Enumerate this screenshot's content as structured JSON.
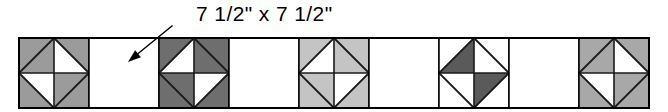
{
  "diagram": {
    "annotation": {
      "label": "7 1/2\" x 7 1/2\"",
      "points_to_block_index": 2,
      "arrow_from": [
        172,
        26
      ],
      "arrow_to": [
        128,
        62
      ]
    },
    "row": {
      "x": 19,
      "y": 38,
      "block_size": 70,
      "block_count": 9,
      "outline_color": "#000000",
      "outline_width": 1.5
    },
    "colors": {
      "background": "#ffffff",
      "outline": "#000000",
      "seam": "#1a1a1a",
      "plain": "#ffffff",
      "shade_medium": "#9b9b9b",
      "shade_medium_light": "#a8a8a8",
      "shade_light": "#c4c4c4",
      "shade_dark": "#6e6e6e",
      "shade_darkest": "#5a5a5a",
      "text": "#000000"
    },
    "blocks": [
      {
        "index": 1,
        "type": "square-in-a-square",
        "fill": "#9b9b9b",
        "corners": "shaded",
        "inner_diamond": "alternating",
        "inner_pattern": [
          "shaded",
          "plain",
          "shaded",
          "plain"
        ]
      },
      {
        "index": 2,
        "type": "plain",
        "fill": "#ffffff",
        "label": "7 1/2\" x 7 1/2\""
      },
      {
        "index": 3,
        "type": "square-in-a-square",
        "fill": "#6e6e6e",
        "corners": "shaded",
        "inner_diamond": "alternating",
        "inner_pattern": [
          "plain",
          "shaded",
          "plain",
          "shaded"
        ]
      },
      {
        "index": 4,
        "type": "plain",
        "fill": "#ffffff"
      },
      {
        "index": 5,
        "type": "square-in-a-square",
        "fill": "#c4c4c4",
        "corners": "shaded",
        "inner_diamond": "alternating",
        "inner_pattern": [
          "plain",
          "shaded",
          "plain",
          "shaded"
        ]
      },
      {
        "index": 6,
        "type": "plain",
        "fill": "#ffffff"
      },
      {
        "index": 7,
        "type": "square-in-a-square",
        "fill": "#5a5a5a",
        "corners": "plain",
        "inner_diamond": "alternating",
        "inner_pattern": [
          "shaded",
          "plain",
          "shaded",
          "plain"
        ]
      },
      {
        "index": 8,
        "type": "plain",
        "fill": "#ffffff"
      },
      {
        "index": 9,
        "type": "square-in-a-square",
        "fill": "#a8a8a8",
        "corners": "mixed",
        "inner_diamond": "alternating",
        "inner_pattern": [
          "shaded",
          "plain",
          "shaded",
          "plain"
        ]
      }
    ]
  }
}
